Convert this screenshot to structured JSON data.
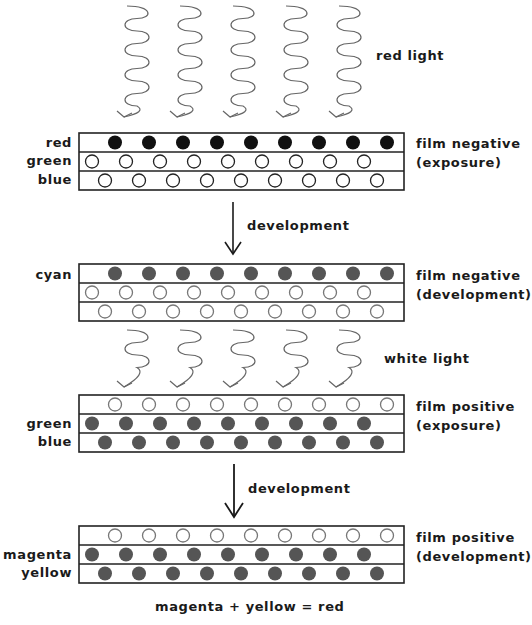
{
  "light_sources": [
    {
      "label": "red light",
      "arrow_count": 5
    },
    {
      "label": "white light",
      "arrow_count": 5
    }
  ],
  "process_steps": [
    {
      "label": "development"
    },
    {
      "label": "development"
    }
  ],
  "stages": [
    {
      "title_line1": "film negative",
      "title_line2": "(exposure)",
      "layer_labels": [
        "red",
        "green",
        "blue"
      ],
      "layers": [
        {
          "state": "filled",
          "color": "#111111"
        },
        {
          "state": "empty",
          "color": "#222222"
        },
        {
          "state": "empty",
          "color": "#222222"
        }
      ]
    },
    {
      "title_line1": "film negative",
      "title_line2": "(development)",
      "layer_labels": [
        "cyan",
        "",
        ""
      ],
      "layers": [
        {
          "state": "filled",
          "color": "#555555"
        },
        {
          "state": "empty",
          "color": "#777777"
        },
        {
          "state": "empty",
          "color": "#777777"
        }
      ]
    },
    {
      "title_line1": "film positive",
      "title_line2": "(exposure)",
      "layer_labels": [
        "",
        "green",
        "blue"
      ],
      "layers": [
        {
          "state": "empty",
          "color": "#777777"
        },
        {
          "state": "filled",
          "color": "#555555"
        },
        {
          "state": "filled",
          "color": "#555555"
        }
      ]
    },
    {
      "title_line1": "film positive",
      "title_line2": "(development)",
      "layer_labels": [
        "",
        "magenta",
        "yellow"
      ],
      "layers": [
        {
          "state": "empty",
          "color": "#777777"
        },
        {
          "state": "filled",
          "color": "#555555"
        },
        {
          "state": "filled",
          "color": "#555555"
        }
      ]
    }
  ],
  "equation": "magenta + yellow = red"
}
